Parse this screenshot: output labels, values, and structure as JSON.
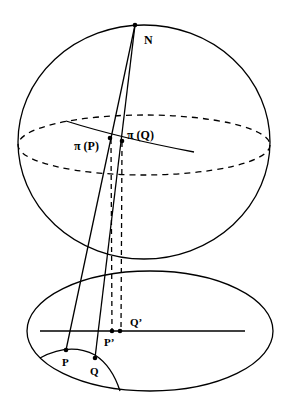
{
  "diagram": {
    "stroke_color": "#000000",
    "background": "#ffffff",
    "labels": {
      "north": "N",
      "pi_p": "π (P)",
      "pi_q": "π (Q)",
      "p_prime": "P’",
      "q_prime": "Q’",
      "p": "P",
      "q": "Q"
    },
    "points": {
      "N": [
        135,
        25
      ],
      "pi_P": [
        110,
        138
      ],
      "pi_Q": [
        122,
        141
      ],
      "P_prime": [
        112,
        331
      ],
      "Q_prime": [
        120,
        331
      ],
      "P": [
        66,
        350
      ],
      "Q": [
        95,
        358
      ]
    },
    "shapes": {
      "sphere": {
        "cx": 144,
        "cy": 142,
        "rx": 126,
        "ry": 117
      },
      "equator": {
        "cx": 144,
        "cy": 145,
        "rx": 126,
        "ry": 30,
        "style": "dashed"
      },
      "plane": {
        "cx": 150,
        "cy": 331,
        "rx": 123,
        "ry": 60
      },
      "plane_line": {
        "x1": 40,
        "x2": 245,
        "y": 331
      }
    }
  }
}
